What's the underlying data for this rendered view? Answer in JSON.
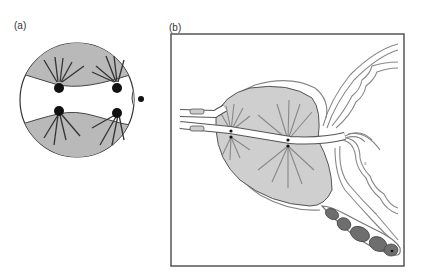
{
  "figure": {
    "panels": [
      {
        "id": "a",
        "label": "(a)",
        "description": "Circular cell cross-section with two grey cap regions (top and bottom), a white central band, four black spindle pole bodies with radiating microtubule lines, and a small lateral nucleus-like structure on the right edge"
      },
      {
        "id": "b",
        "label": "(b)",
        "description": "Framed anatomical diagram: large grey lobed chamber traversed by a white tube with two radiating star (aster) centers, tube openings at left, curved wavy ducts on the right, and a dark segmented beaded structure at lower right"
      }
    ],
    "colors": {
      "grey_fill": "#b9b9b9",
      "light_grey_fill": "#cfcfcf",
      "dark_fill": "#6e6e6e",
      "line": "#444444",
      "frame": "#555555",
      "black": "#111111"
    }
  }
}
